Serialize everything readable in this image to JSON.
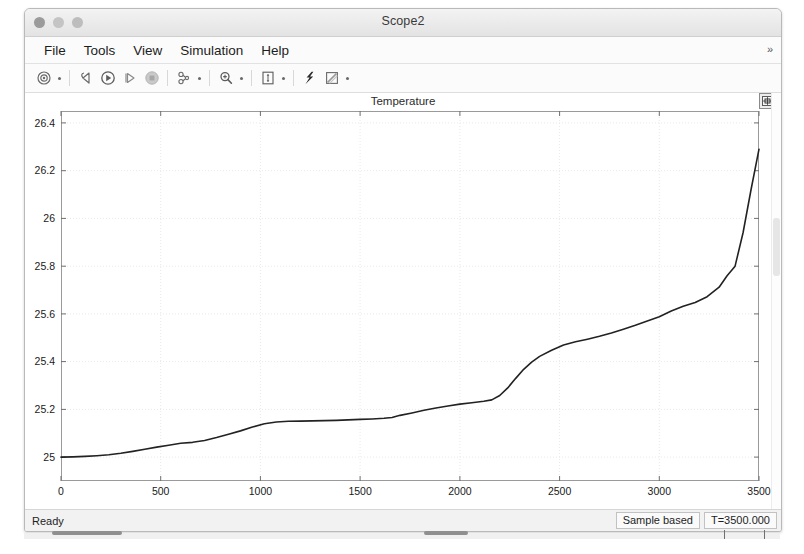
{
  "window": {
    "title": "Scope2",
    "traffic_lights": [
      "close-button",
      "minimize-button",
      "zoom-button"
    ]
  },
  "menubar": {
    "items": [
      {
        "label": "File",
        "name": "menu-file"
      },
      {
        "label": "Tools",
        "name": "menu-tools"
      },
      {
        "label": "View",
        "name": "menu-view"
      },
      {
        "label": "Simulation",
        "name": "menu-simulation"
      },
      {
        "label": "Help",
        "name": "menu-help"
      }
    ],
    "overflow_glyph": "»"
  },
  "toolbar": {
    "buttons": [
      {
        "name": "configuration-properties-icon",
        "label": "Configuration Properties",
        "has_caret": true
      },
      {
        "name": "rewind-icon",
        "label": "Rewind",
        "has_caret": false
      },
      {
        "name": "run-icon",
        "label": "Run",
        "has_caret": false
      },
      {
        "name": "step-forward-icon",
        "label": "Step Forward",
        "has_caret": false
      },
      {
        "name": "stop-icon",
        "label": "Stop",
        "has_caret": false
      },
      {
        "name": "signal-selection-icon",
        "label": "Signal Selection",
        "has_caret": true
      },
      {
        "name": "zoom-in-icon",
        "label": "Zoom In",
        "has_caret": true
      },
      {
        "name": "autoscale-icon",
        "label": "Autoscale",
        "has_caret": true
      },
      {
        "name": "measurements-icon",
        "label": "Cursor Measurements",
        "has_caret": false
      },
      {
        "name": "style-icon",
        "label": "Style",
        "has_caret": true
      }
    ]
  },
  "plot": {
    "float_button": "float-scope-icon",
    "scrollbar": "plot-vertical-scrollbar"
  },
  "statusbar": {
    "ready_label": "Ready",
    "sample_mode": "Sample based",
    "time_value": "T=3500.000"
  },
  "chart_data": {
    "type": "line",
    "title": "Temperature",
    "xlabel": "",
    "ylabel": "",
    "xlim": [
      0,
      3500
    ],
    "ylim": [
      24.9,
      26.45
    ],
    "xticks": [
      0,
      500,
      1000,
      1500,
      2000,
      2500,
      3000,
      3500
    ],
    "yticks": [
      25,
      25.2,
      25.4,
      25.6,
      25.8,
      26,
      26.2,
      26.4
    ],
    "grid": true,
    "legend": null,
    "line_color": "#222222",
    "line_width": 1.6,
    "series": [
      {
        "name": "Temperature",
        "x": [
          0,
          60,
          120,
          180,
          240,
          300,
          360,
          420,
          480,
          540,
          600,
          660,
          720,
          780,
          840,
          900,
          960,
          1020,
          1080,
          1140,
          1200,
          1260,
          1320,
          1380,
          1440,
          1500,
          1560,
          1620,
          1660,
          1700,
          1760,
          1820,
          1880,
          1940,
          2000,
          2060,
          2120,
          2160,
          2200,
          2240,
          2280,
          2320,
          2360,
          2400,
          2460,
          2520,
          2580,
          2640,
          2700,
          2760,
          2820,
          2880,
          2940,
          3000,
          3060,
          3120,
          3180,
          3240,
          3300,
          3340,
          3380,
          3420,
          3460,
          3500
        ],
        "y": [
          25.0,
          25.001,
          25.003,
          25.006,
          25.01,
          25.016,
          25.024,
          25.033,
          25.042,
          25.05,
          25.058,
          25.062,
          25.07,
          25.082,
          25.096,
          25.11,
          25.126,
          25.14,
          25.147,
          25.15,
          25.151,
          25.152,
          25.153,
          25.154,
          25.156,
          25.158,
          25.16,
          25.163,
          25.166,
          25.175,
          25.185,
          25.196,
          25.206,
          25.214,
          25.222,
          25.228,
          25.234,
          25.24,
          25.258,
          25.29,
          25.33,
          25.368,
          25.398,
          25.422,
          25.448,
          25.47,
          25.483,
          25.494,
          25.506,
          25.52,
          25.536,
          25.552,
          25.57,
          25.588,
          25.612,
          25.632,
          25.648,
          25.672,
          25.712,
          25.76,
          25.8,
          25.94,
          26.12,
          26.29
        ]
      }
    ]
  }
}
